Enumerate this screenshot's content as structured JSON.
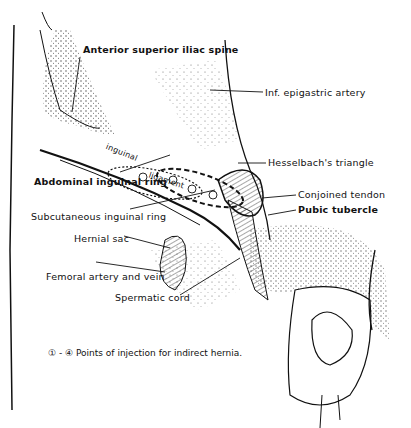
{
  "figure": {
    "labels": {
      "asis": "Anterior superior iliac spine",
      "inf_epigastric": "Inf. epigastric artery",
      "hesselbach": "Hesselbach's triangle",
      "conjoined": "Conjoined tendon",
      "pubic": "Pubic tubercle",
      "abdominal_ring": "Abdominal inguinal ring",
      "subcutaneous_ring": "Subcutaneous inguinal ring",
      "hernial_sac": "Hernial sac",
      "femoral": "Femoral artery and vein",
      "spermatic": "Spermatic cord",
      "inguinal": "inguinal",
      "ligament": "ligament"
    },
    "injection_points": [
      "1",
      "2",
      "3",
      "4"
    ],
    "caption": "① - ④ Points of injection for indirect hernia.",
    "colors": {
      "ink": "#111111",
      "background": "#ffffff"
    }
  }
}
